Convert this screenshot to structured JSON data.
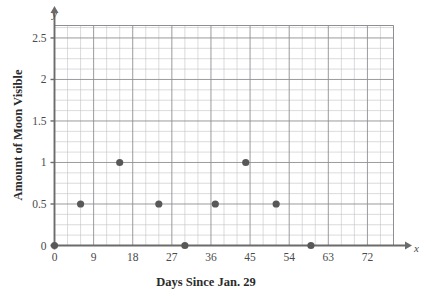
{
  "chart_data": {
    "type": "scatter",
    "title": "",
    "xlabel": "Days Since Jan. 29",
    "ylabel": "Amount of Moon Visible",
    "x_axis_letter": "x",
    "y_axis_letter": "y",
    "xlim": [
      0,
      78
    ],
    "ylim": [
      0,
      2.65
    ],
    "grid": true,
    "grid_minor_x_step": 3,
    "grid_minor_y_step": 0.125,
    "grid_major_x_step": 9,
    "grid_major_y_step": 0.5,
    "legend": "none",
    "xticks": [
      0,
      9,
      18,
      27,
      36,
      45,
      54,
      63,
      72
    ],
    "xtick_labels": [
      "0",
      "9",
      "18",
      "27",
      "36",
      "45",
      "54",
      "63",
      "72"
    ],
    "yticks": [
      0,
      0.5,
      1,
      1.5,
      2,
      2.5
    ],
    "ytick_labels": [
      "0",
      "0.5",
      "1",
      "1.5",
      "2",
      "2.5"
    ],
    "point_color": "#585858",
    "grid_color": "#8e8e94",
    "grid_minor_color": "#c3c3c8",
    "axis_color": "#6b6b6b",
    "points": [
      {
        "x": 0,
        "y": 0
      },
      {
        "x": 6,
        "y": 0.5
      },
      {
        "x": 15,
        "y": 1
      },
      {
        "x": 24,
        "y": 0.5
      },
      {
        "x": 30,
        "y": 0
      },
      {
        "x": 37,
        "y": 0.5
      },
      {
        "x": 44,
        "y": 1
      },
      {
        "x": 51,
        "y": 0.5
      },
      {
        "x": 59,
        "y": 0
      }
    ]
  }
}
